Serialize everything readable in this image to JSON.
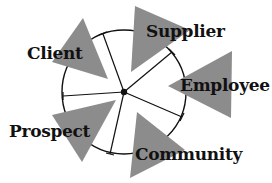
{
  "diagram": {
    "type": "radial-stakeholder",
    "center": {
      "x": 124,
      "y": 92
    },
    "circle_radius": 62,
    "colors": {
      "triangle_fill": "#8c8c8c",
      "line": "#111111",
      "text": "#111111",
      "background": "#ffffff"
    },
    "nodes": [
      {
        "id": "client",
        "label": "Client",
        "label_pos": {
          "x": 27,
          "y": 45
        }
      },
      {
        "id": "supplier",
        "label": "Supplier",
        "label_pos": {
          "x": 146,
          "y": 23
        }
      },
      {
        "id": "employee",
        "label": "Employee",
        "label_pos": {
          "x": 180,
          "y": 77
        }
      },
      {
        "id": "prospect",
        "label": "Prospect",
        "label_pos": {
          "x": 9,
          "y": 123
        }
      },
      {
        "id": "community",
        "label": "Community",
        "label_pos": {
          "x": 135,
          "y": 146
        }
      }
    ]
  }
}
